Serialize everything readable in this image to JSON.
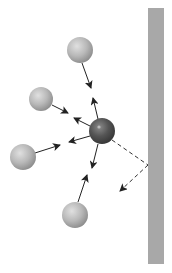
{
  "diagram": {
    "colors": {
      "background": "#ffffff",
      "wall": "#a8a8a8",
      "molecule_light": "#b9b9b9",
      "molecule_dark": "#555555",
      "arrow": "#222222"
    },
    "wall": {
      "x": 148,
      "y": 8,
      "width": 16,
      "height": 256
    },
    "central_particle": {
      "cx": 102,
      "cy": 131,
      "r": 13
    },
    "molecules": [
      {
        "name": "top",
        "cx": 80,
        "cy": 50,
        "r": 13
      },
      {
        "name": "upper-left",
        "cx": 41,
        "cy": 99,
        "r": 12
      },
      {
        "name": "lower-left",
        "cx": 23,
        "cy": 157,
        "r": 13
      },
      {
        "name": "bottom",
        "cx": 75,
        "cy": 215,
        "r": 13
      }
    ],
    "reflection_path": {
      "start": [
        110,
        140
      ],
      "wall_hit": [
        148,
        165
      ],
      "end": [
        118,
        193
      ]
    }
  }
}
